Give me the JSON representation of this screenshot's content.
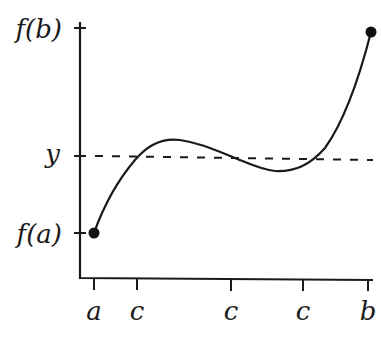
{
  "diagram": {
    "y_axis": {
      "labels": [
        {
          "id": "fb",
          "text": "f(b)"
        },
        {
          "id": "y",
          "text": "y"
        },
        {
          "id": "fa",
          "text": "f(a)"
        }
      ]
    },
    "x_axis": {
      "labels": [
        {
          "id": "a",
          "text": "a"
        },
        {
          "id": "c1",
          "text": "c"
        },
        {
          "id": "c2",
          "text": "c"
        },
        {
          "id": "c3",
          "text": "c"
        },
        {
          "id": "b",
          "text": "b"
        }
      ]
    },
    "elements": {
      "curve": "continuous function f from (a, f(a)) to (b, f(b))",
      "dashed_line": "horizontal line at level y",
      "endpoints": [
        "(a, f(a))",
        "(b, f(b))"
      ]
    },
    "colors": {
      "ink": "#1a1a1a",
      "background": "#ffffff"
    }
  }
}
